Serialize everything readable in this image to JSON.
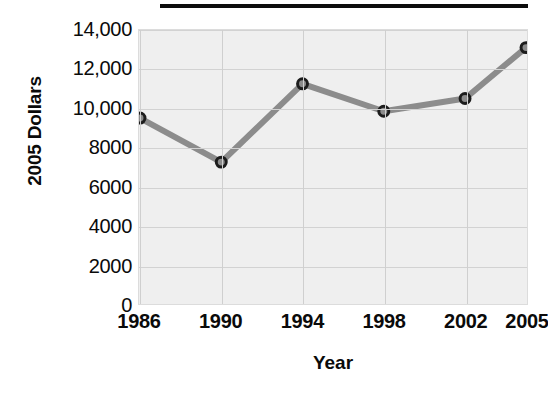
{
  "chart_data": {
    "type": "line",
    "title": "",
    "xlabel": "Year",
    "ylabel": "2005 Dollars",
    "categories": [
      "1986",
      "1990",
      "1994",
      "1998",
      "2002",
      "2005"
    ],
    "x_numeric": [
      1986,
      1990,
      1994,
      1998,
      2002,
      2005
    ],
    "values": [
      9500,
      7250,
      11250,
      9850,
      10500,
      13100
    ],
    "series": [
      {
        "name": "2005 Dollars",
        "values": [
          9500,
          7250,
          11250,
          9850,
          10500,
          13100
        ]
      }
    ],
    "ylim": [
      0,
      14000
    ],
    "y_ticks": [
      0,
      2000,
      4000,
      6000,
      8000,
      10000,
      12000,
      14000
    ],
    "y_tick_labels": [
      "0",
      "2000",
      "4000",
      "6000",
      "8000",
      "10,000",
      "12,000",
      "14,000"
    ],
    "x_tick_labels": [
      "1986",
      "1990",
      "1994",
      "1998",
      "2002",
      "2005"
    ],
    "grid": true,
    "grid_axes": "both",
    "legend": false,
    "legend_position": "none",
    "marker": "circle",
    "annotations": []
  },
  "style": {
    "line_color": "#8c8c8c",
    "marker_fill": "#8c8c8c",
    "marker_stroke": "#1c1c1c",
    "plot_background": "#efefef",
    "grid_color": "#d2d2d2",
    "text_color": "#0a0a0a",
    "page_background": "#ffffff",
    "title_rule_color": "#0d0d0d"
  },
  "decorations": {
    "top_rule_label": "title-underline-rule"
  }
}
